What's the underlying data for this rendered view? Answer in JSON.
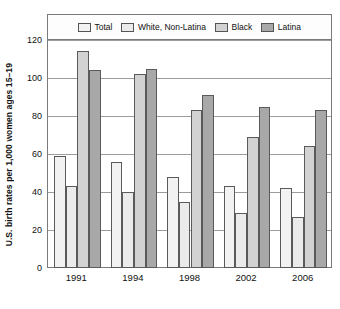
{
  "chart_data": {
    "type": "bar",
    "title": "",
    "subtitle": "",
    "xlabel": "",
    "ylabel": "U.S. birth rates per 1,000 women ages 15–19",
    "categories": [
      "1991",
      "1994",
      "1998",
      "2002",
      "2006"
    ],
    "series": [
      {
        "name": "Total",
        "values": [
          59,
          56,
          48,
          43,
          42
        ],
        "color": "#f2f2f2"
      },
      {
        "name": "White, Non-Latina",
        "values": [
          43,
          40,
          35,
          29,
          27
        ],
        "color": "#ebebeb"
      },
      {
        "name": "Black",
        "values": [
          114,
          102,
          83,
          69,
          64
        ],
        "color": "#d2d2d2"
      },
      {
        "name": "Latina",
        "values": [
          104,
          105,
          91,
          85,
          83
        ],
        "color": "#a8a8a8"
      }
    ],
    "ylim": [
      0,
      120
    ],
    "yticks": [
      0,
      20,
      40,
      60,
      80,
      100,
      120
    ],
    "ytick_labels": [
      "0",
      "20",
      "40",
      "60",
      "80",
      "100",
      "120"
    ],
    "grid": "horizontal",
    "legend_position": "top-inside",
    "bar_border_color": "#5a5a5a",
    "gridline_color": "#9c9c9c",
    "frame_color": "#7a7a7a",
    "background_color": "#ffffff"
  }
}
